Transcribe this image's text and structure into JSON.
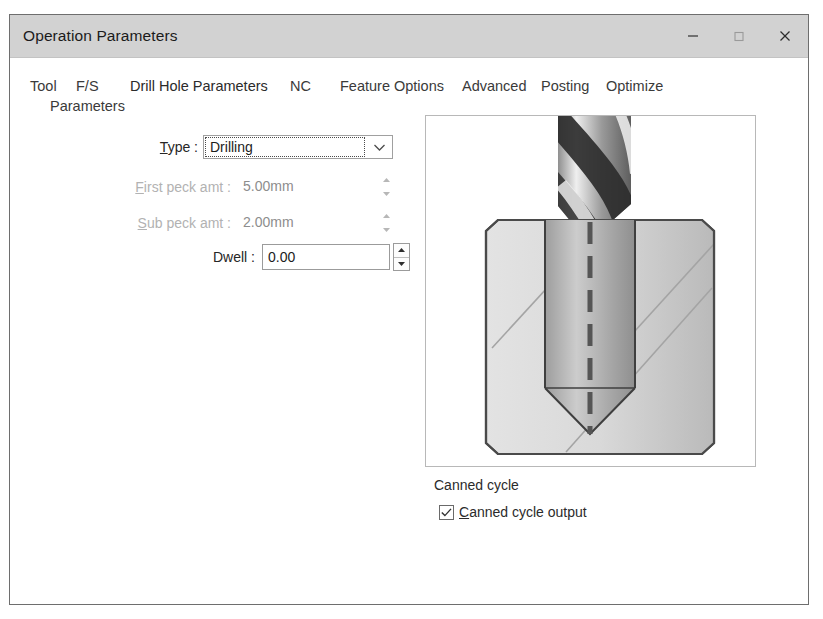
{
  "window": {
    "title": "Operation Parameters",
    "controls": [
      {
        "name": "minimize",
        "glyph": "minimize-icon"
      },
      {
        "name": "maximize",
        "glyph": "maximize-icon"
      },
      {
        "name": "close",
        "glyph": "close-icon"
      }
    ]
  },
  "tabs": [
    {
      "label": "Tool",
      "label2": "Parameters",
      "selected": false
    },
    {
      "label": "F/S",
      "selected": false
    },
    {
      "label": "Drill Hole Parameters",
      "selected": true
    },
    {
      "label": "NC",
      "selected": false
    },
    {
      "label": "Feature Options",
      "selected": false
    },
    {
      "label": "Advanced",
      "selected": false
    },
    {
      "label": "Posting",
      "selected": false
    },
    {
      "label": "Optimize",
      "selected": false
    }
  ],
  "form": {
    "type": {
      "label": "Type :",
      "accel": "T",
      "label_rest": "ype :",
      "value": "Drilling",
      "enabled": true,
      "focused": true
    },
    "first_peck": {
      "label": "First peck amt :",
      "accel": "F",
      "label_rest": "irst peck amt :",
      "value": "5.00mm",
      "enabled": false
    },
    "sub_peck": {
      "label": "Sub peck amt :",
      "accel": "S",
      "label_rest": "ub peck amt :",
      "value": "2.00mm",
      "enabled": false
    },
    "dwell": {
      "label": "Dwell :",
      "value": "0.00",
      "enabled": true
    }
  },
  "preview": {
    "alt": "drill-bit-cross-section-illustration"
  },
  "canned_cycle": {
    "group_label": "Canned cycle",
    "checkbox_accel": "C",
    "checkbox_label_rest": "anned cycle output",
    "checkbox_label": "Canned cycle output",
    "checked": true
  },
  "colors": {
    "titlebar": "#d2d2d2",
    "dialog_border": "#6e6e6e",
    "text": "#262626",
    "disabled_text": "#8d8d8d"
  }
}
